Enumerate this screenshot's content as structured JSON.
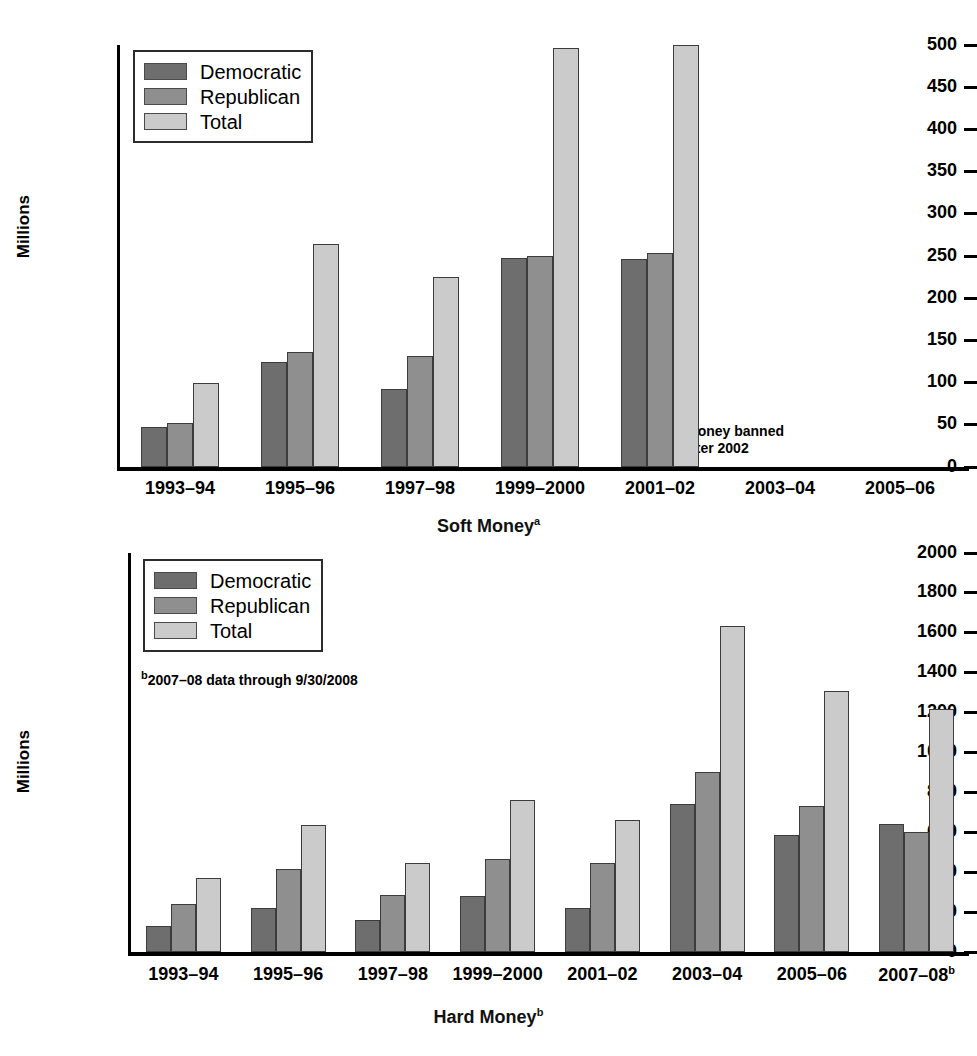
{
  "figure": {
    "yaxis_label": "Millions",
    "series_names": [
      "Democratic",
      "Republican",
      "Total"
    ],
    "colors": {
      "democratic": "#6e6e6e",
      "republican": "#8f8f8f",
      "total": "#cbcbcb",
      "axis": "#000000",
      "background": "#ffffff"
    }
  },
  "charts": [
    {
      "id": "soft-money",
      "xlabel": "Soft Money",
      "xlabel_superscript": "a",
      "note": {
        "marker": "a",
        "line1": "Soft money banned",
        "line2": "after 2002"
      },
      "legend": [
        "Democratic",
        "Republican",
        "Total"
      ],
      "yticks": [
        "0",
        "50",
        "100",
        "150",
        "200",
        "250",
        "300",
        "350",
        "400",
        "450",
        "500"
      ],
      "categories": [
        "1993–94",
        "1995–96",
        "1997–98",
        "1999–2000",
        "2001–02",
        "2003–04",
        "2005–06"
      ]
    },
    {
      "id": "hard-money",
      "xlabel": "Hard Money",
      "xlabel_superscript": "b",
      "note": {
        "marker": "b",
        "line1": "2007–08 data through 9/30/2008",
        "line2": ""
      },
      "legend": [
        "Democratic",
        "Republican",
        "Total"
      ],
      "yticks": [
        "0",
        "200",
        "400",
        "600",
        "800",
        "1000",
        "1200",
        "1400",
        "1600",
        "1800",
        "2000"
      ],
      "categories": [
        "1993–94",
        "1995–96",
        "1997–98",
        "1999–2000",
        "2001–02",
        "2003–04",
        "2005–06",
        "2007–08"
      ],
      "last_category_superscript": "b"
    }
  ],
  "chart_data": [
    {
      "type": "bar",
      "title": "Soft Money",
      "xlabel": "Soft Money (a: Soft money banned after 2002)",
      "ylabel": "Millions",
      "ylim": [
        0,
        500
      ],
      "ytick_step": 50,
      "grid": false,
      "legend_position": "top-left",
      "categories": [
        "1993–94",
        "1995–96",
        "1997–98",
        "1999–2000",
        "2001–02",
        "2003–04",
        "2005–06"
      ],
      "series": [
        {
          "name": "Democratic",
          "values": [
            48,
            124,
            93,
            248,
            247,
            null,
            null
          ]
        },
        {
          "name": "Republican",
          "values": [
            52,
            136,
            131,
            250,
            254,
            null,
            null
          ]
        },
        {
          "name": "Total",
          "values": [
            100,
            264,
            225,
            496,
            500,
            null,
            null
          ]
        }
      ],
      "annotations": [
        "aSoft money banned after 2002"
      ]
    },
    {
      "type": "bar",
      "title": "Hard Money",
      "xlabel": "Hard Money (b: 2007-08 data through 9/30/2008)",
      "ylabel": "Millions",
      "ylim": [
        0,
        2000
      ],
      "ytick_step": 200,
      "grid": false,
      "legend_position": "top-left",
      "categories": [
        "1993–94",
        "1995–96",
        "1997–98",
        "1999–2000",
        "2001–02",
        "2003–04",
        "2005–06",
        "2007–08"
      ],
      "series": [
        {
          "name": "Democratic",
          "values": [
            130,
            220,
            160,
            280,
            220,
            740,
            585,
            640
          ]
        },
        {
          "name": "Republican",
          "values": [
            240,
            415,
            285,
            465,
            445,
            900,
            730,
            600
          ]
        },
        {
          "name": "Total",
          "values": [
            370,
            635,
            445,
            760,
            660,
            1635,
            1310,
            1220
          ]
        }
      ],
      "annotations": [
        "b2007-08 data through 9/30/2008"
      ]
    }
  ]
}
